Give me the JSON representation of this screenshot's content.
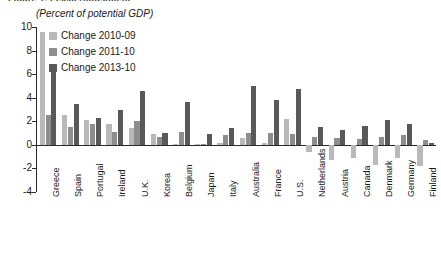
{
  "figure": {
    "header": "Figure 1.  Fiscal Adjustment",
    "subtitle": "(Percent of potential GDP)"
  },
  "chart_data": {
    "type": "bar",
    "title": "",
    "subtitle": "(Percent of potential GDP)",
    "xlabel": "",
    "ylabel": "",
    "ylim": [
      -4,
      10
    ],
    "yticks": [
      10,
      8,
      6,
      4,
      2,
      0,
      -2,
      -4
    ],
    "ytick_labels": [
      "10",
      "8",
      "6",
      "4",
      "2",
      "0",
      "-2",
      "-4"
    ],
    "grid": false,
    "legend_position": "top-left",
    "categories": [
      "Greece",
      "Spain",
      "Portugal",
      "Ireland",
      "U.K.",
      "Korea",
      "Belgium",
      "Japan",
      "Italy",
      "Australia",
      "France",
      "U.S.",
      "Netherlands",
      "Austria",
      "Canada",
      "Denmark",
      "Germany",
      "Finland"
    ],
    "series": [
      {
        "name": "Change 2010-09",
        "color": "#b9b9b9",
        "values": [
          9.6,
          2.5,
          2.1,
          1.8,
          1.4,
          0.9,
          0.1,
          0.1,
          0.2,
          0.6,
          0.2,
          2.2,
          -0.6,
          -1.3,
          -1.1,
          -1.7,
          -1.1,
          -1.8
        ]
      },
      {
        "name": "Change 2011-10",
        "color": "#8e8e8e",
        "values": [
          2.5,
          1.5,
          1.8,
          1.1,
          2.0,
          0.7,
          1.1,
          0.1,
          0.8,
          1.0,
          1.0,
          0.9,
          0.7,
          0.6,
          0.5,
          0.7,
          0.8,
          0.4
        ]
      },
      {
        "name": "Change 2013-10",
        "color": "#595959",
        "values": [
          6.2,
          3.5,
          2.3,
          3.0,
          4.6,
          1.0,
          3.6,
          0.9,
          1.4,
          5.0,
          3.8,
          4.7,
          1.5,
          1.3,
          1.6,
          2.1,
          1.8,
          0.2
        ]
      }
    ]
  }
}
